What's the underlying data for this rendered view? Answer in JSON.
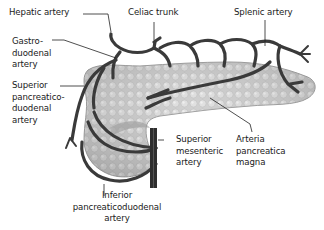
{
  "diagram": {
    "colors": {
      "vessel": "#3a3a3a",
      "pancreas_fill": "#c9c9c9",
      "pancreas_edge": "#9a9a9a",
      "leader_line": "#222222",
      "label_text": "#1a1a1a"
    },
    "labels": {
      "hepatic_artery": "Hepatic artery",
      "celiac_trunk": "Celiac trunk",
      "splenic_artery": "Splenic artery",
      "gastroduodenal_artery": "Gastro-\nduodenal\nartery",
      "superior_pancreaticoduodenal_artery": "Superior\npancreatico-\nduodenal\nartery",
      "superior_mesenteric_artery": "Superior\nmesenteric\nartery",
      "arteria_pancreatica_magna": "Arteria\npancreatica\nmagna",
      "inferior_pancreaticoduodenal_artery": "Inferior\npancreaticoduodenal\nartery"
    }
  }
}
